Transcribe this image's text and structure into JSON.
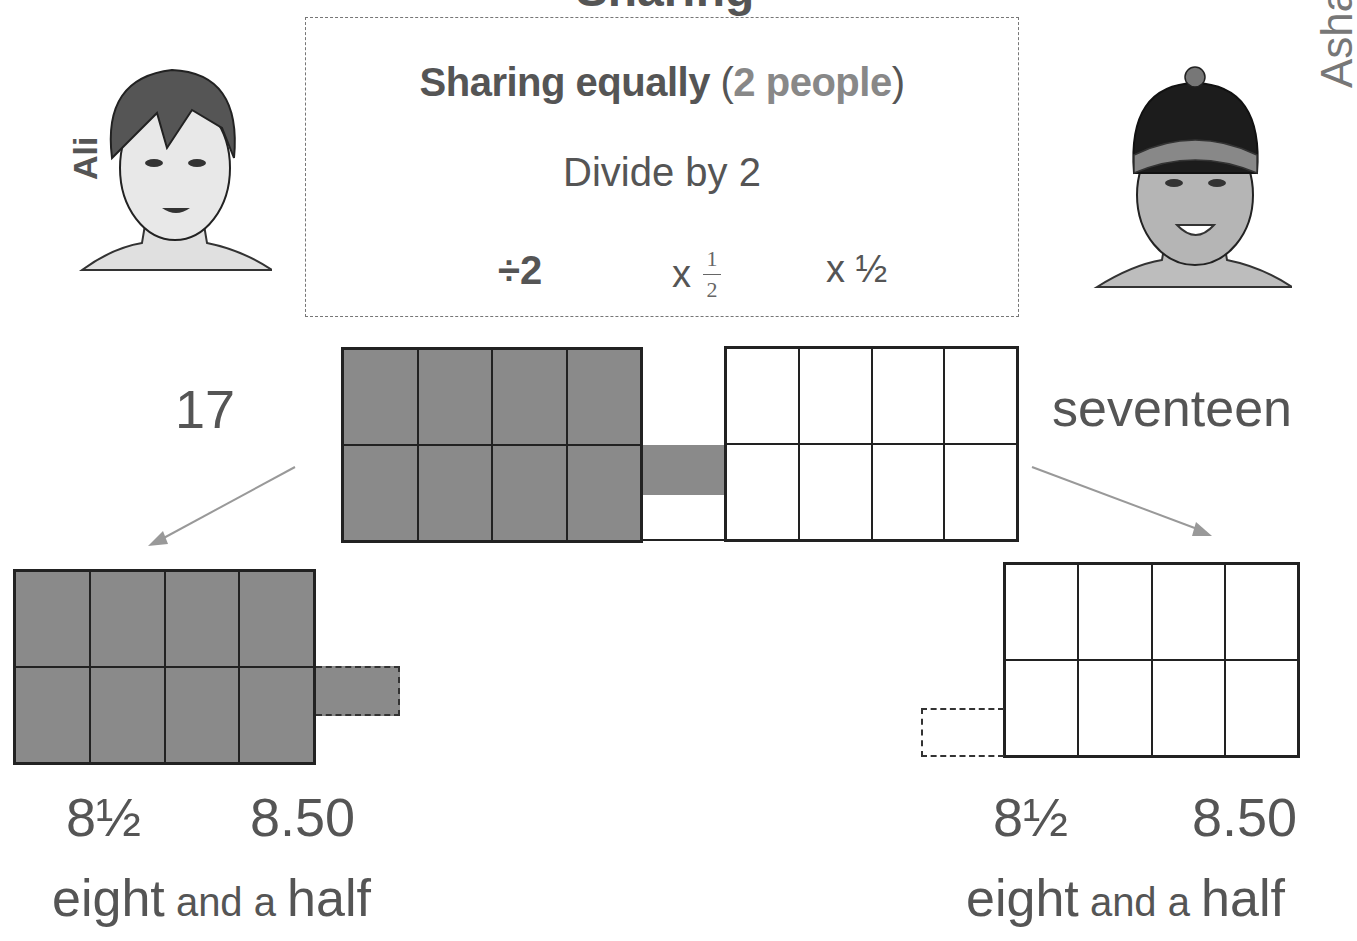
{
  "header": {
    "clipped_title": "Sharing"
  },
  "info_box": {
    "title_bold": "Sharing equally",
    "title_paren_open": "(",
    "title_paren_inner": "2 people",
    "title_paren_close": ")",
    "subtitle": "Divide by 2",
    "operations": {
      "divide": "÷2",
      "times_fraction_prefix": "x",
      "fraction_numerator": "1",
      "fraction_denominator": "2",
      "times_half": "x ½"
    }
  },
  "people": {
    "left": {
      "name": "Ali"
    },
    "right": {
      "name": "Asha"
    }
  },
  "total": {
    "numeral": "17",
    "word": "seventeen"
  },
  "results": {
    "left": {
      "fraction": "8½",
      "decimal": "8.50",
      "words_1": "eight",
      "words_2": " and a ",
      "words_3": "half"
    },
    "right": {
      "fraction": "8½",
      "decimal": "8.50",
      "words_1": "eight",
      "words_2": " and a ",
      "words_3": "half"
    }
  },
  "colors": {
    "shaded": "#8a8a8a",
    "text": "#555555",
    "text_light": "#888888",
    "arrow": "#999999"
  }
}
